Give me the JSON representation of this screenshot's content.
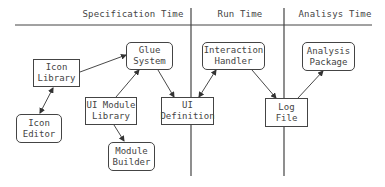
{
  "headers": {
    "specification": "Specification Time",
    "run": "Run Time",
    "analysis": "Analisys Time"
  },
  "nodes": {
    "icon_library": {
      "line1": "Icon",
      "line2": "Library",
      "shape": "rect"
    },
    "glue_system": {
      "line1": "Glue",
      "line2": "System",
      "shape": "rounded"
    },
    "icon_editor": {
      "line1": "Icon",
      "line2": "Editor",
      "shape": "rounded"
    },
    "ui_module_library": {
      "line1": "UI Module",
      "line2": "Library",
      "shape": "rect"
    },
    "module_builder": {
      "line1": "Module",
      "line2": "Builder",
      "shape": "rounded"
    },
    "ui_definition": {
      "line1": "UI",
      "line2": "Definition",
      "shape": "rect"
    },
    "interaction_handler": {
      "line1": "Interaction",
      "line2": "Handler",
      "shape": "rounded"
    },
    "log_file": {
      "line1": "Log",
      "line2": "File",
      "shape": "rect"
    },
    "analysis_package": {
      "line1": "Analysis",
      "line2": "Package",
      "shape": "rounded"
    }
  },
  "edges": [
    {
      "from": "icon_editor",
      "to": "icon_library",
      "direction": "both"
    },
    {
      "from": "icon_library",
      "to": "glue_system",
      "direction": "forward"
    },
    {
      "from": "ui_module_library",
      "to": "glue_system",
      "direction": "forward"
    },
    {
      "from": "ui_module_library",
      "to": "module_builder",
      "direction": "forward"
    },
    {
      "from": "glue_system",
      "to": "ui_definition",
      "direction": "forward"
    },
    {
      "from": "interaction_handler",
      "to": "ui_definition",
      "direction": "both"
    },
    {
      "from": "interaction_handler",
      "to": "log_file",
      "direction": "forward"
    },
    {
      "from": "log_file",
      "to": "analysis_package",
      "direction": "forward"
    }
  ]
}
